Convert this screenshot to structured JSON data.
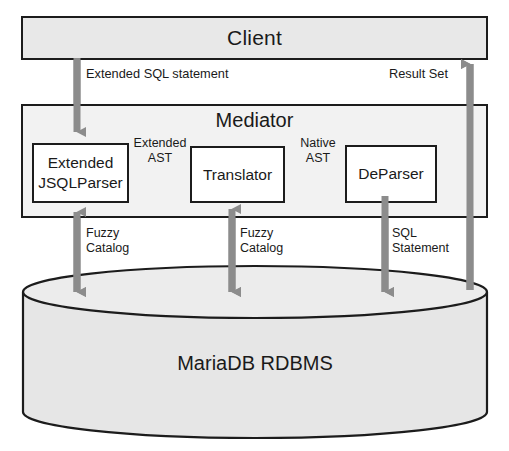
{
  "diagram": {
    "nodes": {
      "client": "Client",
      "mediator": "Mediator",
      "parser": "Extended\nJSQLParser",
      "parser_line1": "Extended",
      "parser_line2": "JSQLParser",
      "translator": "Translator",
      "deparser": "DeParser",
      "database": "MariaDB RDBMS"
    },
    "edges": {
      "extended_sql_statement": "Extended SQL  statement",
      "result_set": "Result Set",
      "extended_ast": "Extended\nAST",
      "native_ast": "Native\nAST",
      "fuzzy_catalog_left": "Fuzzy\nCatalog",
      "fuzzy_catalog_mid": "Fuzzy\nCatalog",
      "sql_statement": "SQL\nStatement"
    },
    "colors": {
      "box_fill": "#e8e8e8",
      "mediator_fill": "#f2f2f2",
      "inner_fill": "#ffffff",
      "stroke": "#1c1c1c",
      "thick_arrow": "#8c8c8c",
      "thin_arrow": "#9a9a9a",
      "cylinder_fill": "#e6e6e6",
      "background": "#ffffff"
    }
  }
}
